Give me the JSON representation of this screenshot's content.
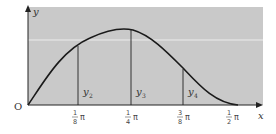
{
  "diagram": {
    "axis_labels": {
      "x": "x",
      "y": "y",
      "origin": "O"
    },
    "ticks": [
      {
        "num": "1",
        "den": "8",
        "suffix": "π"
      },
      {
        "num": "1",
        "den": "4",
        "suffix": "π"
      },
      {
        "num": "3",
        "den": "8",
        "suffix": "π"
      },
      {
        "num": "1",
        "den": "2",
        "suffix": "π"
      }
    ],
    "ordinates": [
      {
        "label": "y",
        "sub": "2"
      },
      {
        "label": "y",
        "sub": "3"
      },
      {
        "label": "y",
        "sub": "4"
      }
    ],
    "colors": {
      "shade": "#c9c9c9",
      "curve": "#1a1a1a",
      "axis": "#222222",
      "gridline": "#ececec"
    }
  }
}
